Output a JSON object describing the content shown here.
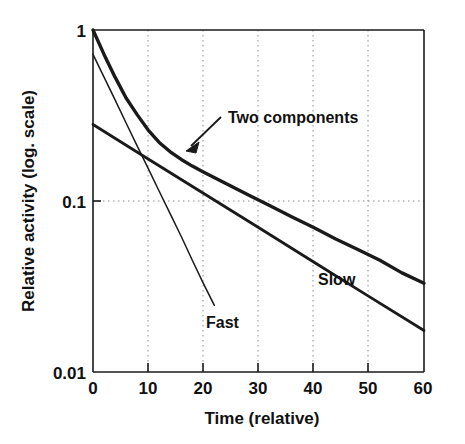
{
  "chart_data": {
    "type": "line",
    "title": "",
    "xlabel": "Time (relative)",
    "ylabel": "Relative activity (log. scale)",
    "yscale": "log",
    "xlim": [
      0,
      60
    ],
    "ylim": [
      0.01,
      1
    ],
    "grid": "dotted vertical gridlines at x ticks and horizontal gridline at y=0.1",
    "legend_position": "inline annotations on curves",
    "xticks": [
      "0",
      "10",
      "20",
      "30",
      "40",
      "50",
      "60"
    ],
    "xtick_values": [
      0,
      10,
      20,
      30,
      40,
      50,
      60
    ],
    "yticks": [
      "1",
      "0.1",
      "0.01"
    ],
    "ytick_values": [
      1,
      0.1,
      0.01
    ],
    "series": [
      {
        "name": "Two components",
        "style": "thick",
        "description": "Sum of fast and slow exponential components",
        "x": [
          0,
          2,
          4,
          6,
          8,
          10,
          12,
          14,
          16,
          18,
          20,
          24,
          28,
          32,
          36,
          40,
          44,
          48,
          52,
          56,
          60
        ],
        "y": [
          1.0,
          0.72,
          0.53,
          0.4,
          0.32,
          0.26,
          0.22,
          0.194,
          0.175,
          0.16,
          0.148,
          0.127,
          0.109,
          0.094,
          0.081,
          0.07,
          0.06,
          0.052,
          0.045,
          0.038,
          0.033
        ]
      },
      {
        "name": "Fast",
        "style": "thin",
        "description": "Fast exponential component",
        "x": [
          0,
          2,
          4,
          6,
          8,
          10,
          12,
          14,
          16,
          18,
          20,
          22
        ],
        "y": [
          0.72,
          0.53,
          0.39,
          0.286,
          0.21,
          0.155,
          0.114,
          0.084,
          0.062,
          0.045,
          0.033,
          0.0245
        ]
      },
      {
        "name": "Slow",
        "style": "thick",
        "description": "Slow exponential component",
        "x": [
          0,
          10,
          20,
          30,
          40,
          50,
          60
        ],
        "y": [
          0.28,
          0.176,
          0.111,
          0.07,
          0.044,
          0.0277,
          0.0175
        ]
      }
    ],
    "annotations": [
      {
        "name": "two-components",
        "text": "Two components",
        "x": 23,
        "y": 0.31,
        "arrow_from": [
          23,
          0.3
        ],
        "arrow_to": [
          17.5,
          0.195
        ]
      },
      {
        "name": "fast",
        "text": "Fast",
        "x": 21,
        "y": 0.031
      },
      {
        "name": "slow",
        "text": "Slow",
        "x": 41,
        "y": 0.053
      }
    ],
    "colors": {
      "line": "#1a1a1a",
      "grid": "#999999",
      "axis": "#1a1a1a",
      "background": "#ffffff"
    }
  }
}
